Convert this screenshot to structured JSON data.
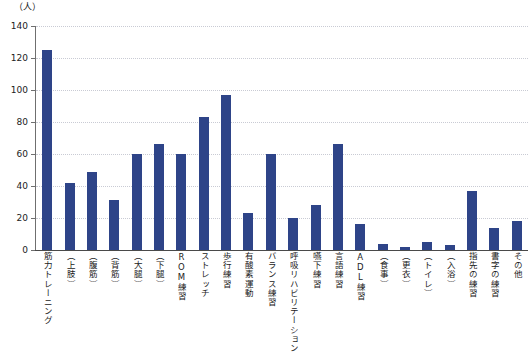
{
  "chart_data": {
    "type": "bar",
    "title": "",
    "subtitle": "",
    "xlabel": "",
    "ylabel": "（人）",
    "unit_label": "（人）",
    "ylim": [
      0,
      140
    ],
    "ytick_step": 20,
    "yticks": [
      140,
      120,
      100,
      80,
      60,
      40,
      20,
      0
    ],
    "grid": true,
    "legend": false,
    "bar_color": "#2e4488",
    "gridline_color": "#c9cbd4",
    "axis_color": "#4a4a4a",
    "categories": [
      "筋力トレーニング",
      "（上肢）",
      "（腹筋）",
      "（背筋）",
      "（大腿）",
      "（下腿）",
      "ROM練習",
      "ストレッチ",
      "歩行練習",
      "有酸素運動",
      "バランス練習",
      "呼吸リハビリテーション",
      "嚥下練習",
      "言語練習",
      "ADL練習",
      "（食事）",
      "（更衣）",
      "（トイレ）",
      "（入浴）",
      "指先の練習",
      "書字の練習",
      "その他"
    ],
    "values": [
      125,
      42,
      49,
      31,
      60,
      66,
      60,
      83,
      97,
      23,
      60,
      20,
      28,
      66,
      16,
      4,
      2,
      5,
      3,
      37,
      14,
      18
    ]
  }
}
